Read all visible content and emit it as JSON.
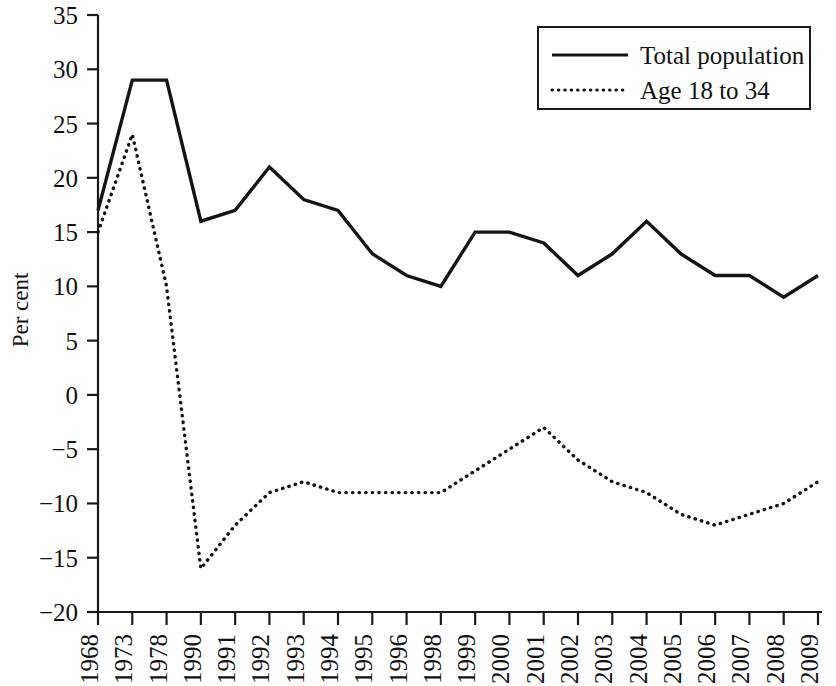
{
  "chart_data": {
    "type": "line",
    "title": "",
    "xlabel": "",
    "ylabel": "Per cent",
    "ylim": [
      -20,
      35
    ],
    "ytick_step": 5,
    "yticks": [
      "35",
      "30",
      "25",
      "20",
      "15",
      "10",
      "5",
      "0",
      "−5",
      "−10",
      "−15",
      "−20"
    ],
    "grid": false,
    "legend_position": "top-right",
    "categories": [
      "1968",
      "1973",
      "1978",
      "1990",
      "1991",
      "1992",
      "1993",
      "1994",
      "1995",
      "1996",
      "1998",
      "1999",
      "2000",
      "2001",
      "2002",
      "2003",
      "2004",
      "2005",
      "2006",
      "2007",
      "2008",
      "2009"
    ],
    "series": [
      {
        "name": "Total population",
        "style": "solid",
        "color": "#141414",
        "values": [
          17,
          29,
          29,
          16,
          17,
          21,
          18,
          17,
          13,
          11,
          10,
          15,
          15,
          14,
          11,
          13,
          16,
          13,
          11,
          11,
          9,
          11
        ]
      },
      {
        "name": "Age 18 to 34",
        "style": "dotted",
        "color": "#141414",
        "values": [
          15,
          24,
          10,
          -16,
          -12,
          -9,
          -8,
          -9,
          -9,
          -9,
          -9,
          -7,
          -5,
          -3,
          -6,
          -8,
          -9,
          -11,
          -12,
          -11,
          -10,
          -8
        ]
      }
    ]
  },
  "legend": {
    "entries": [
      {
        "label": "Total population",
        "style": "solid"
      },
      {
        "label": "Age 18 to 34",
        "style": "dotted"
      }
    ]
  },
  "axes": {
    "y_axis_title": "Per cent"
  }
}
